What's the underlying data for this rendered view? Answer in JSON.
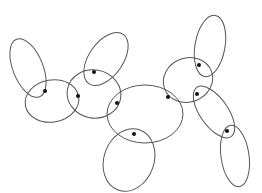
{
  "diagram": {
    "title": "",
    "width": 262,
    "height": 193,
    "stroke_color": "#555555",
    "dot_color": "#111111",
    "background": "#ffffff",
    "ellipses": [
      {
        "id": "A",
        "cx": 28,
        "cy": 68,
        "rx": 15,
        "ry": 31,
        "rotate": -22
      },
      {
        "id": "B",
        "cx": 52,
        "cy": 101,
        "rx": 27,
        "ry": 21,
        "rotate": -10
      },
      {
        "id": "C",
        "cx": 94,
        "cy": 94,
        "rx": 27,
        "ry": 24,
        "rotate": 10
      },
      {
        "id": "D",
        "cx": 106,
        "cy": 59,
        "rx": 17,
        "ry": 30,
        "rotate": 35
      },
      {
        "id": "E",
        "cx": 145,
        "cy": 114,
        "rx": 38,
        "ry": 29,
        "rotate": 0
      },
      {
        "id": "F",
        "cx": 188,
        "cy": 80,
        "rx": 25,
        "ry": 22,
        "rotate": -20
      },
      {
        "id": "G",
        "cx": 210,
        "cy": 46,
        "rx": 15,
        "ry": 31,
        "rotate": 10
      },
      {
        "id": "H",
        "cx": 214,
        "cy": 112,
        "rx": 14,
        "ry": 30,
        "rotate": -35
      },
      {
        "id": "I",
        "cx": 235,
        "cy": 156,
        "rx": 14,
        "ry": 31,
        "rotate": -8
      },
      {
        "id": "J",
        "cx": 129,
        "cy": 160,
        "rx": 25,
        "ry": 32,
        "rotate": 20
      }
    ],
    "dots": [
      {
        "id": "d1",
        "cx": 45,
        "cy": 91
      },
      {
        "id": "d2",
        "cx": 78,
        "cy": 96
      },
      {
        "id": "d3",
        "cx": 94,
        "cy": 72
      },
      {
        "id": "d4",
        "cx": 117,
        "cy": 103
      },
      {
        "id": "d5",
        "cx": 134,
        "cy": 134
      },
      {
        "id": "d6",
        "cx": 168,
        "cy": 97
      },
      {
        "id": "d7",
        "cx": 199,
        "cy": 65
      },
      {
        "id": "d8",
        "cx": 197,
        "cy": 94
      },
      {
        "id": "d9",
        "cx": 227,
        "cy": 131
      }
    ],
    "dot_radius": 2
  }
}
